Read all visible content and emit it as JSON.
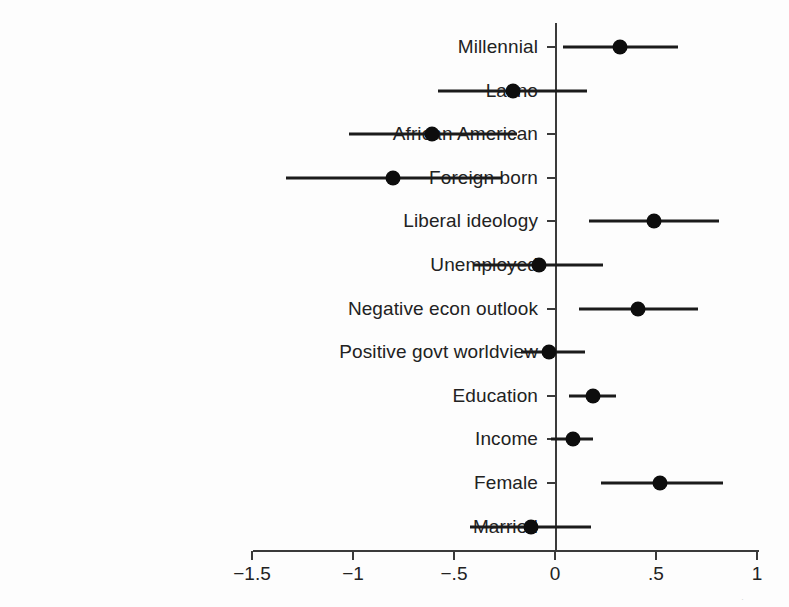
{
  "chart_data": {
    "type": "scatter",
    "title": "",
    "subtitle": "",
    "xlabel": "",
    "ylabel": "",
    "xlim": [
      -1.75,
      1.05
    ],
    "ylim": [
      0,
      13
    ],
    "grid": false,
    "legend": null,
    "orientation": "horizontal",
    "marker": "filled-circle",
    "error_bars": "95% confidence interval",
    "reference_line": 0,
    "x_ticks": [
      -1.5,
      -1,
      -0.5,
      0,
      0.5,
      1
    ],
    "x_tick_labels": [
      "−1.5",
      "−1",
      "−.5",
      "0",
      ".5",
      "1"
    ],
    "categories": [
      "Millennial",
      "Latino",
      "African American",
      "Foreign born",
      "Liberal ideology",
      "Unemployed",
      "Negative econ outlook",
      "Positive govt worldview",
      "Education",
      "Income",
      "Female",
      "Married"
    ],
    "values": [
      0.32,
      -0.21,
      -0.61,
      -0.8,
      0.49,
      -0.08,
      0.41,
      -0.03,
      0.19,
      0.09,
      0.52,
      -0.12
    ],
    "ci_low": [
      0.04,
      -0.58,
      -1.02,
      -1.33,
      0.17,
      -0.4,
      0.12,
      -0.17,
      0.07,
      -0.02,
      0.23,
      -0.42
    ],
    "ci_high": [
      0.61,
      0.16,
      -0.19,
      -0.26,
      0.81,
      0.24,
      0.71,
      0.15,
      0.3,
      0.19,
      0.83,
      0.18
    ],
    "points": [
      {
        "label": "Millennial",
        "estimate": 0.32,
        "ci_low": 0.04,
        "ci_high": 0.61
      },
      {
        "label": "Latino",
        "estimate": -0.21,
        "ci_low": -0.58,
        "ci_high": 0.16
      },
      {
        "label": "African American",
        "estimate": -0.61,
        "ci_low": -1.02,
        "ci_high": -0.19
      },
      {
        "label": "Foreign born",
        "estimate": -0.8,
        "ci_low": -1.33,
        "ci_high": -0.26
      },
      {
        "label": "Liberal ideology",
        "estimate": 0.49,
        "ci_low": 0.17,
        "ci_high": 0.81
      },
      {
        "label": "Unemployed",
        "estimate": -0.08,
        "ci_low": -0.4,
        "ci_high": 0.24
      },
      {
        "label": "Negative econ outlook",
        "estimate": 0.41,
        "ci_low": 0.12,
        "ci_high": 0.71
      },
      {
        "label": "Positive govt worldview",
        "estimate": -0.03,
        "ci_low": -0.17,
        "ci_high": 0.15
      },
      {
        "label": "Education",
        "estimate": 0.19,
        "ci_low": 0.07,
        "ci_high": 0.3
      },
      {
        "label": "Income",
        "estimate": 0.09,
        "ci_low": -0.02,
        "ci_high": 0.19
      },
      {
        "label": "Female",
        "estimate": 0.52,
        "ci_low": 0.23,
        "ci_high": 0.83
      },
      {
        "label": "Married",
        "estimate": -0.12,
        "ci_low": -0.42,
        "ci_high": 0.18
      }
    ],
    "colors": {
      "marker": "#0d0d0d",
      "line": "#1b1b1b",
      "axis": "#3a3a3a",
      "text": "#222222",
      "background": "#fdfdfd"
    }
  },
  "artifact": {
    "corner_mark": "·"
  }
}
